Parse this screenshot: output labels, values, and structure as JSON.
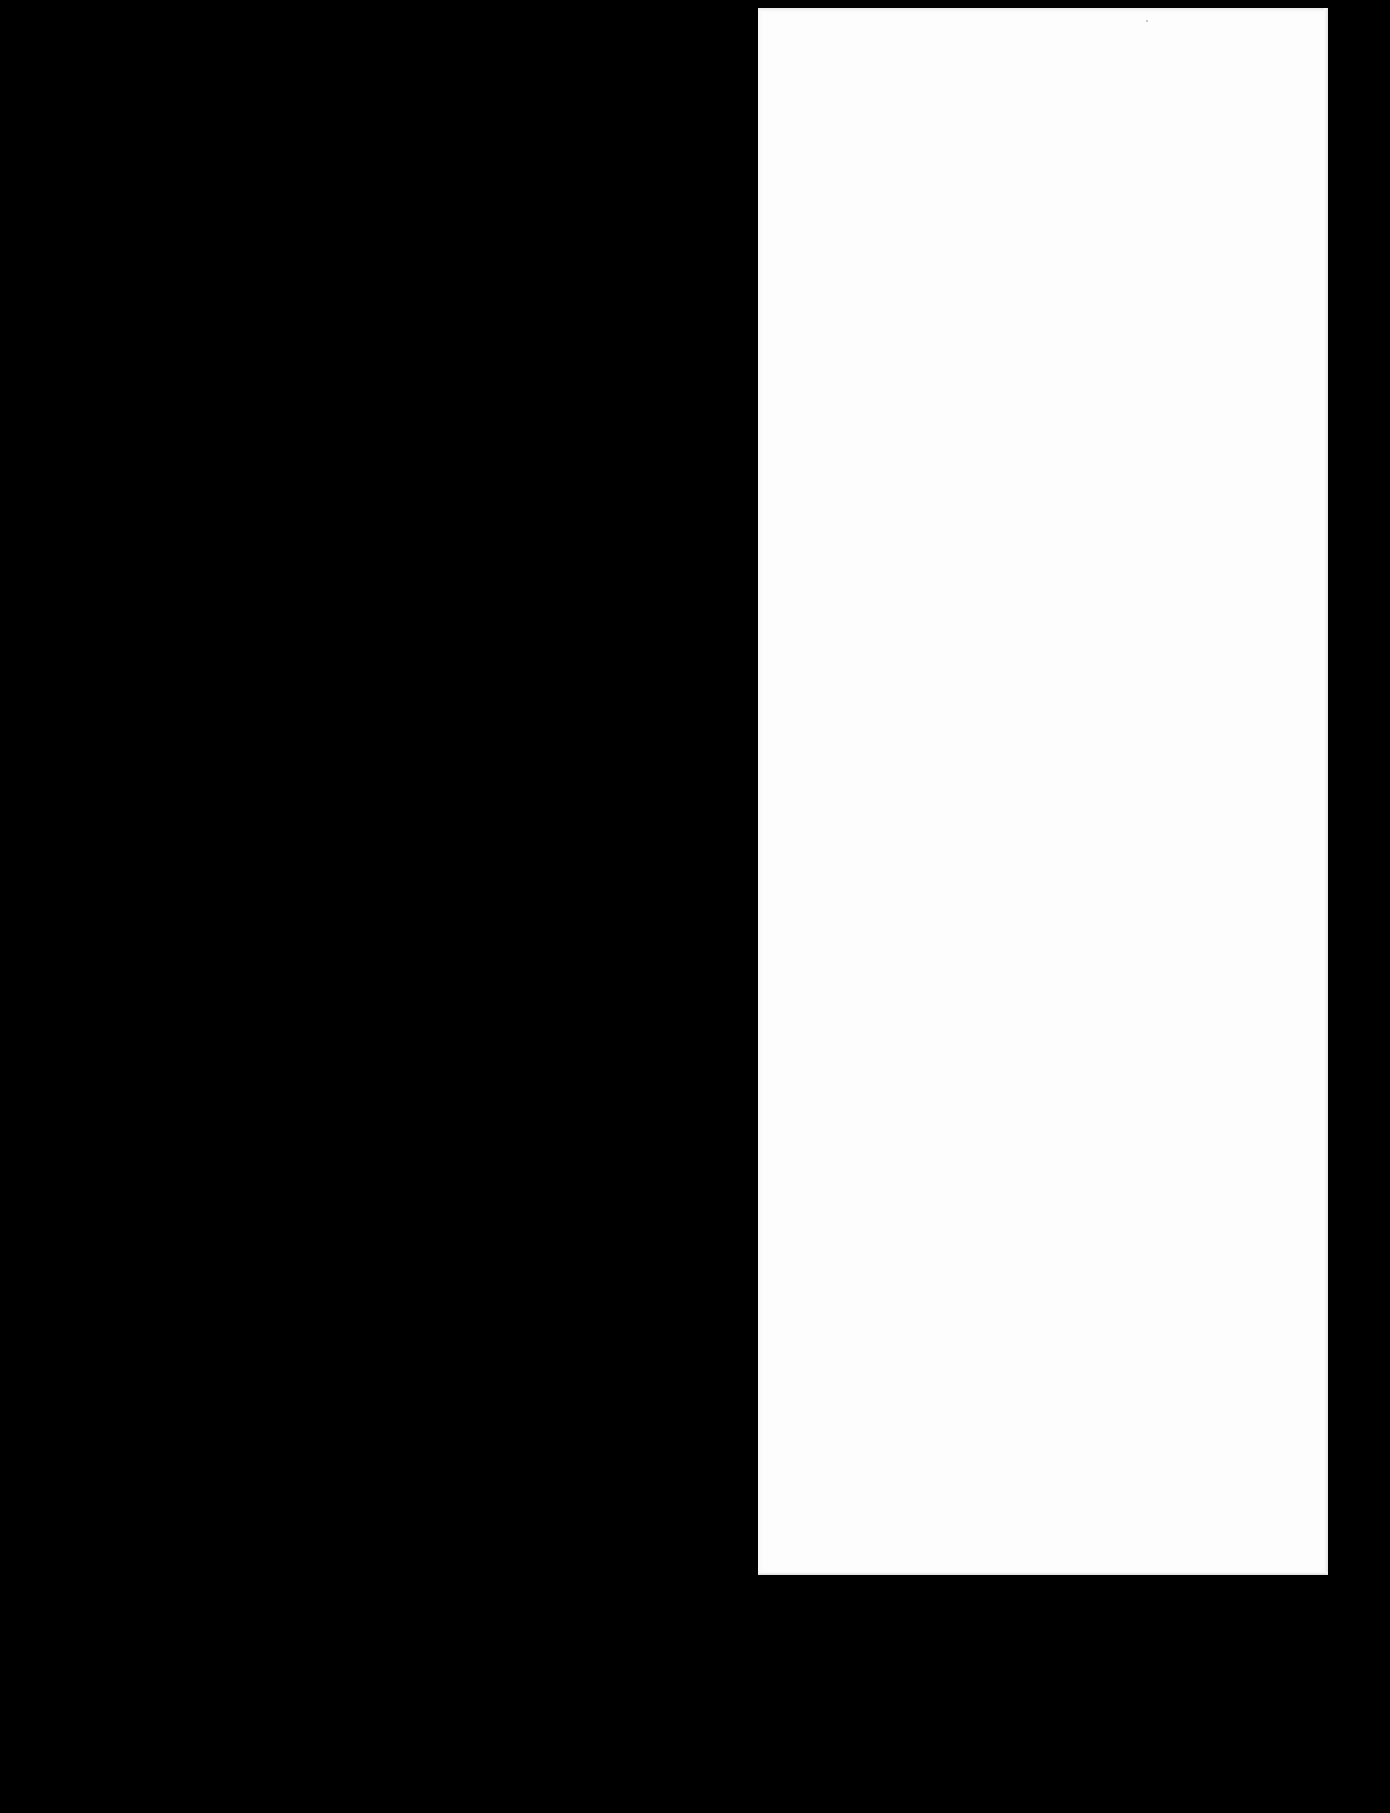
{
  "document": {
    "type": "scanned-page",
    "page_text": "",
    "background_color": "#000000",
    "page_color": "#fdfdfd"
  }
}
